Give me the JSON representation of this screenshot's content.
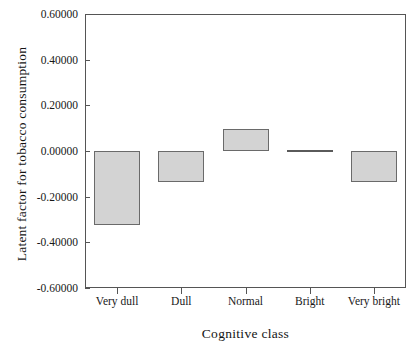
{
  "chart_data": {
    "type": "bar",
    "title": "",
    "xlabel": "Cognitive class",
    "ylabel": "Latent factor for tobacco consumption",
    "categories": [
      "Very dull",
      "Dull",
      "Normal",
      "Bright",
      "Very bright"
    ],
    "values": [
      -0.325,
      -0.135,
      0.095,
      0.0,
      -0.135
    ],
    "ylim": [
      -0.6,
      0.6
    ],
    "ytick_values": [
      0.6,
      0.4,
      0.2,
      0.0,
      -0.2,
      -0.4,
      -0.6
    ],
    "ytick_labels": [
      "0.60000",
      "0.40000",
      "0.20000",
      "0.00000",
      "-0.20000",
      "-0.40000",
      "-0.60000"
    ],
    "grid": false,
    "legend": null,
    "bar_fill_color": "#d3d3d3",
    "bar_border_color": "#6a6a6a",
    "axis_color": "#555555",
    "baseline": 0.0
  }
}
